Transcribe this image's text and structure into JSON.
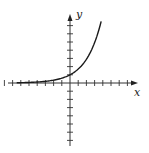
{
  "chart_data": {
    "type": "line",
    "title": "",
    "xlabel": "x",
    "ylabel": "y",
    "function": "exponential growth (approx. y = 2^x / ... rising curve)",
    "x": [
      -7,
      -6,
      -5,
      -4,
      -3,
      -2,
      -1,
      0,
      1,
      2,
      3,
      4
    ],
    "values": [
      0.01,
      0.02,
      0.04,
      0.08,
      0.15,
      0.3,
      0.55,
      1,
      1.8,
      3.2,
      5,
      7.3
    ],
    "xlim": [
      -8,
      8
    ],
    "ylim": [
      -7,
      8
    ],
    "grid": false,
    "axes": {
      "x_ticks_left": 8,
      "x_ticks_right": 7,
      "y_ticks_up": 7,
      "y_ticks_down": 7
    },
    "colors": {
      "curve": "#1a1a1a",
      "axes": "#333333"
    }
  },
  "labels": {
    "x": "x",
    "y": "y"
  }
}
